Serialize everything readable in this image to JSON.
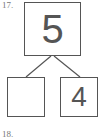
{
  "problem": {
    "number": "17.",
    "next_number": "18.",
    "whole": "5",
    "part_left": "",
    "part_right": "4"
  },
  "colors": {
    "stroke": "#555555",
    "text": "#555555"
  }
}
